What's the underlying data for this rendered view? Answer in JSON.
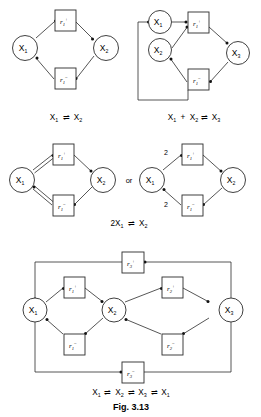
{
  "figure": {
    "number_label": "Fig. 3.13",
    "node_prefix": "X",
    "rate_prefix": "r",
    "or_separator": "or",
    "arrow_glyph": "⇌",
    "plus_glyph": "+",
    "stroke_color": "#2b2b2b",
    "background_color": "#ffffff"
  },
  "panels": [
    {
      "id": "panel-1",
      "caption": "X₁ ⇌ X₂",
      "caption_parts": [
        {
          "base": "X",
          "sub": "1"
        },
        {
          "base": "⇌",
          "sub": ""
        },
        {
          "base": "X",
          "sub": "2"
        }
      ],
      "nodes": [
        {
          "name": "node-x1",
          "label": "X",
          "sub": "1"
        },
        {
          "name": "node-x2",
          "label": "X",
          "sub": "2"
        }
      ],
      "transitions": [
        {
          "name": "transition-r1-plus",
          "label": "r",
          "sub": "1",
          "sup": "+"
        },
        {
          "name": "transition-r1-minus",
          "label": "r",
          "sub": "1",
          "sup": "−"
        }
      ],
      "weights": []
    },
    {
      "id": "panel-2",
      "caption": "X₁ + X₂ ⇌ X₃",
      "caption_parts": [
        {
          "base": "X",
          "sub": "1"
        },
        {
          "base": "+",
          "sub": ""
        },
        {
          "base": "X",
          "sub": "2"
        },
        {
          "base": "⇌",
          "sub": ""
        },
        {
          "base": "X",
          "sub": "3"
        }
      ],
      "nodes": [
        {
          "name": "node-x1",
          "label": "X",
          "sub": "1"
        },
        {
          "name": "node-x2",
          "label": "X",
          "sub": "2"
        },
        {
          "name": "node-x3",
          "label": "X",
          "sub": "3"
        }
      ],
      "transitions": [
        {
          "name": "transition-r1-plus",
          "label": "r",
          "sub": "1",
          "sup": "+"
        },
        {
          "name": "transition-r1-minus",
          "label": "r",
          "sub": "1",
          "sup": "−"
        }
      ],
      "weights": []
    },
    {
      "id": "panel-3a",
      "caption": "2X₁ ⇌ X₂",
      "caption_parts": [
        {
          "base": "2X",
          "sub": "1"
        },
        {
          "base": "⇌",
          "sub": ""
        },
        {
          "base": "X",
          "sub": "2"
        }
      ],
      "nodes": [
        {
          "name": "node-x1",
          "label": "X",
          "sub": "1"
        },
        {
          "name": "node-x2",
          "label": "X",
          "sub": "2"
        }
      ],
      "transitions": [
        {
          "name": "transition-r1-plus",
          "label": "r",
          "sub": "1",
          "sup": "+"
        },
        {
          "name": "transition-r1-minus",
          "label": "r",
          "sub": "1",
          "sup": "−"
        }
      ],
      "weights": []
    },
    {
      "id": "panel-3b",
      "caption": "",
      "nodes": [
        {
          "name": "node-x1",
          "label": "X",
          "sub": "1"
        },
        {
          "name": "node-x2",
          "label": "X",
          "sub": "2"
        }
      ],
      "transitions": [
        {
          "name": "transition-r1-plus",
          "label": "r",
          "sub": "1",
          "sup": "+"
        },
        {
          "name": "transition-r1-minus",
          "label": "r",
          "sub": "1",
          "sup": "−"
        }
      ],
      "weights": [
        {
          "name": "edge-weight-in",
          "value": "2"
        },
        {
          "name": "edge-weight-out",
          "value": "2"
        }
      ]
    },
    {
      "id": "panel-4",
      "caption": "X₁ ⇌ X₂ ⇌ X₃ ⇌ X₁",
      "caption_parts": [
        {
          "base": "X",
          "sub": "1"
        },
        {
          "base": "⇌",
          "sub": ""
        },
        {
          "base": "X",
          "sub": "2"
        },
        {
          "base": "⇌",
          "sub": ""
        },
        {
          "base": "X",
          "sub": "3"
        },
        {
          "base": "⇌",
          "sub": ""
        },
        {
          "base": "X",
          "sub": "1"
        }
      ],
      "nodes": [
        {
          "name": "node-x1",
          "label": "X",
          "sub": "1"
        },
        {
          "name": "node-x2",
          "label": "X",
          "sub": "2"
        },
        {
          "name": "node-x3",
          "label": "X",
          "sub": "3"
        }
      ],
      "transitions": [
        {
          "name": "transition-r1-plus",
          "label": "r",
          "sub": "1",
          "sup": "+"
        },
        {
          "name": "transition-r1-minus",
          "label": "r",
          "sub": "1",
          "sup": "−"
        },
        {
          "name": "transition-r2-plus",
          "label": "r",
          "sub": "2",
          "sup": "+"
        },
        {
          "name": "transition-r2-minus",
          "label": "r",
          "sub": "2",
          "sup": "−"
        },
        {
          "name": "transition-r3-plus",
          "label": "r",
          "sub": "3",
          "sup": "+"
        },
        {
          "name": "transition-r3-minus",
          "label": "r",
          "sub": "3",
          "sup": "−"
        }
      ],
      "weights": []
    }
  ]
}
